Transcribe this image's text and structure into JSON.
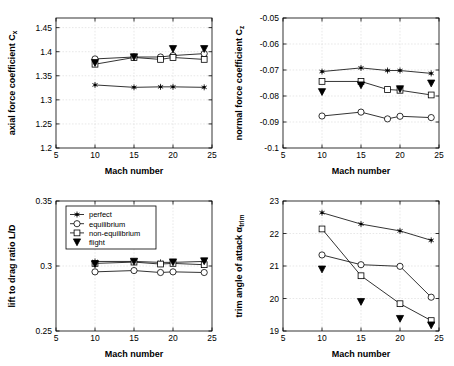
{
  "figure": {
    "shared_xlabel": "Mach number",
    "legend_position": "upper-left of bottom-left panel",
    "legend_entries": [
      {
        "label": "perfect",
        "marker": "star"
      },
      {
        "label": "equilibrium",
        "marker": "circle"
      },
      {
        "label": "non-equilibrium",
        "marker": "square"
      },
      {
        "label": "flight",
        "marker": "triangle-down-filled"
      }
    ]
  },
  "chart_data": [
    {
      "id": "axial-force",
      "type": "line",
      "title": "",
      "xlabel": "Mach number",
      "ylabel": "axial force coefficient C_x",
      "ylabel_main": "axial force coefficient C",
      "ylabel_sub": "x",
      "xlim": [
        5,
        25
      ],
      "ylim": [
        1.2,
        1.47
      ],
      "xticks": [
        5,
        10,
        15,
        20,
        25
      ],
      "yticks": [
        1.2,
        1.25,
        1.3,
        1.35,
        1.4,
        1.45
      ],
      "ytick_labels": [
        "1.2",
        "1.25",
        "1.3",
        "1.35",
        "1.4",
        "1.45"
      ],
      "grid": true,
      "series": [
        {
          "name": "perfect",
          "marker": "star",
          "x": [
            10,
            15,
            18.4,
            20,
            24
          ],
          "values": [
            1.331,
            1.326,
            1.327,
            1.327,
            1.326
          ]
        },
        {
          "name": "equilibrium",
          "marker": "circle",
          "x": [
            10,
            15,
            18.4,
            20,
            24
          ],
          "values": [
            1.385,
            1.389,
            1.389,
            1.392,
            1.396
          ]
        },
        {
          "name": "non-equilibrium",
          "marker": "square",
          "x": [
            10,
            15,
            18.4,
            20,
            24
          ],
          "values": [
            1.374,
            1.388,
            1.384,
            1.388,
            1.384
          ]
        },
        {
          "name": "flight",
          "marker": "triangle-down-filled",
          "x": [
            10,
            15,
            20,
            24
          ],
          "values": [
            1.377,
            1.389,
            1.406,
            1.406
          ]
        }
      ]
    },
    {
      "id": "normal-force",
      "type": "line",
      "title": "",
      "xlabel": "Mach number",
      "ylabel": "normal force coefficient C_z",
      "ylabel_main": "normal force coefficient C",
      "ylabel_sub": "z",
      "xlim": [
        5,
        25
      ],
      "ylim": [
        -0.1,
        -0.05
      ],
      "xticks": [
        5,
        10,
        15,
        20,
        25
      ],
      "yticks": [
        -0.1,
        -0.09,
        -0.08,
        -0.07,
        -0.06,
        -0.05
      ],
      "ytick_labels": [
        "-0.1",
        "-0.09",
        "-0.08",
        "-0.07",
        "-0.06",
        "-0.05"
      ],
      "grid": true,
      "series": [
        {
          "name": "perfect",
          "marker": "star",
          "x": [
            10,
            15,
            18.4,
            20,
            24
          ],
          "values": [
            -0.0706,
            -0.0692,
            -0.0702,
            -0.0702,
            -0.0713
          ]
        },
        {
          "name": "equilibrium",
          "marker": "circle",
          "x": [
            10,
            15,
            18.4,
            20,
            24
          ],
          "values": [
            -0.0877,
            -0.0862,
            -0.0888,
            -0.0878,
            -0.0883
          ]
        },
        {
          "name": "non-equilibrium",
          "marker": "square",
          "x": [
            10,
            15,
            18.4,
            20,
            24
          ],
          "values": [
            -0.0744,
            -0.0744,
            -0.0775,
            -0.0778,
            -0.0796
          ]
        },
        {
          "name": "flight",
          "marker": "triangle-down-filled",
          "x": [
            10,
            15,
            20,
            24
          ],
          "values": [
            -0.0784,
            -0.0758,
            -0.0773,
            -0.0751
          ]
        }
      ]
    },
    {
      "id": "lift-to-drag",
      "type": "line",
      "title": "",
      "xlabel": "Mach number",
      "ylabel": "lift to drag ratio L/D",
      "ylabel_main": "lift to drag ratio L/D",
      "ylabel_sub": "",
      "xlim": [
        5,
        25
      ],
      "ylim": [
        0.25,
        0.35
      ],
      "xticks": [
        5,
        10,
        15,
        20,
        25
      ],
      "yticks": [
        0.25,
        0.3,
        0.35
      ],
      "ytick_labels": [
        "0.25",
        "0.3",
        "0.35"
      ],
      "grid": true,
      "series": [
        {
          "name": "perfect",
          "marker": "star",
          "x": [
            10,
            15,
            18.4,
            20,
            24
          ],
          "values": [
            0.3035,
            0.3035,
            0.3028,
            0.3028,
            0.3035
          ]
        },
        {
          "name": "equilibrium",
          "marker": "circle",
          "x": [
            10,
            15,
            18.4,
            20,
            24
          ],
          "values": [
            0.2955,
            0.2965,
            0.295,
            0.2955,
            0.295
          ]
        },
        {
          "name": "non-equilibrium",
          "marker": "square",
          "x": [
            10,
            15,
            18.4,
            20,
            24
          ],
          "values": [
            0.302,
            0.303,
            0.3015,
            0.302,
            0.301
          ]
        },
        {
          "name": "flight",
          "marker": "triangle-down-filled",
          "x": [
            10,
            15,
            20,
            24
          ],
          "values": [
            0.3015,
            0.3035,
            0.303,
            0.3038
          ]
        }
      ]
    },
    {
      "id": "trim-angle",
      "type": "line",
      "title": "",
      "xlabel": "Mach number",
      "ylabel": "trim angle of attack alpha_trim",
      "ylabel_main": "trim angle of attack α",
      "ylabel_sub": "trim",
      "xlim": [
        5,
        25
      ],
      "ylim": [
        19,
        23
      ],
      "xticks": [
        5,
        10,
        15,
        20,
        25
      ],
      "yticks": [
        19,
        20,
        21,
        22,
        23
      ],
      "ytick_labels": [
        "19",
        "20",
        "21",
        "22",
        "23"
      ],
      "grid": true,
      "series": [
        {
          "name": "perfect",
          "marker": "star",
          "x": [
            10,
            15,
            20,
            24
          ],
          "values": [
            22.64,
            22.29,
            22.08,
            21.79
          ]
        },
        {
          "name": "equilibrium",
          "marker": "circle",
          "x": [
            10,
            15,
            20,
            24
          ],
          "values": [
            21.34,
            21.04,
            20.99,
            20.04
          ]
        },
        {
          "name": "non-equilibrium",
          "marker": "square",
          "x": [
            10,
            15,
            20,
            24
          ],
          "values": [
            22.14,
            20.7,
            19.84,
            19.32
          ]
        },
        {
          "name": "flight",
          "marker": "triangle-down-filled",
          "x": [
            10,
            15,
            20,
            24
          ],
          "values": [
            20.9,
            19.9,
            19.38,
            19.18
          ]
        }
      ]
    }
  ]
}
